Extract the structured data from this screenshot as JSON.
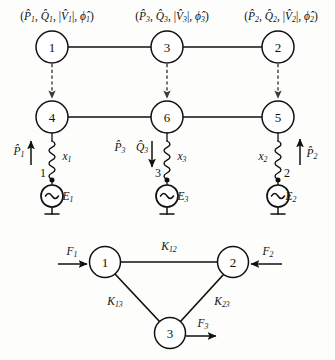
{
  "figure": {
    "title_visible": false,
    "background_color": "#fdfdfc",
    "line_color": "#111111",
    "dashed_color": "#3a3a3a"
  },
  "upper_diagram": {
    "measurement_labels": [
      {
        "id": "meas-bus-1",
        "text": "(P̂1, Q̂1, |V̂1|, ϕ̂1)",
        "parts": {
          "p": "P",
          "q": "Q",
          "v": "V",
          "phi": "ϕ",
          "index": "1"
        }
      },
      {
        "id": "meas-bus-3",
        "text": "(P̂3, Q̂3, |V̂3|, ϕ̂3)",
        "parts": {
          "p": "P",
          "q": "Q",
          "v": "V",
          "phi": "ϕ",
          "index": "3"
        }
      },
      {
        "id": "meas-bus-2",
        "text": "(P̂2, Q̂2, |V̂2|, ϕ̂2)",
        "parts": {
          "p": "P",
          "q": "Q",
          "v": "V",
          "phi": "ϕ",
          "index": "2"
        }
      }
    ],
    "top_nodes": [
      {
        "label": "1",
        "cx": 52,
        "cy": 47
      },
      {
        "label": "3",
        "cx": 167,
        "cy": 47
      },
      {
        "label": "2",
        "cx": 278,
        "cy": 47
      }
    ],
    "mid_nodes": [
      {
        "label": "4",
        "cx": 52,
        "cy": 117
      },
      {
        "label": "6",
        "cx": 167,
        "cy": 117
      },
      {
        "label": "5",
        "cx": 278,
        "cy": 117
      }
    ],
    "generators": [
      {
        "bus_number": "1",
        "emf_label": "E",
        "emf_index": "1",
        "reactance_label": "x",
        "reactance_index": "1",
        "cx": 52
      },
      {
        "bus_number": "3",
        "emf_label": "E",
        "emf_index": "3",
        "reactance_label": "x",
        "reactance_index": "3",
        "cx": 167
      },
      {
        "bus_number": "2",
        "emf_label": "E",
        "emf_index": "2",
        "reactance_label": "x",
        "reactance_index": "2",
        "cx": 278
      }
    ],
    "injection_labels": [
      {
        "symbol": "P",
        "index": "1",
        "direction": "up"
      },
      {
        "symbol": "P",
        "index": "3",
        "direction": "down"
      },
      {
        "symbol": "Q",
        "index": "3",
        "direction": "down"
      },
      {
        "symbol": "P",
        "index": "2",
        "direction": "up"
      }
    ]
  },
  "lower_diagram": {
    "nodes": [
      {
        "label": "1",
        "cx": 105,
        "cy": 262
      },
      {
        "label": "2",
        "cx": 233,
        "cy": 262
      },
      {
        "label": "3",
        "cx": 170,
        "cy": 333
      }
    ],
    "edges": [
      {
        "id": "edge-12",
        "label": "K",
        "index": "12"
      },
      {
        "id": "edge-13",
        "label": "K",
        "index": "13"
      },
      {
        "id": "edge-23",
        "label": "K",
        "index": "23"
      }
    ],
    "forces": [
      {
        "id": "force-1",
        "label": "F",
        "index": "1",
        "direction": "right"
      },
      {
        "id": "force-2",
        "label": "F",
        "index": "2",
        "direction": "left"
      },
      {
        "id": "force-3",
        "label": "F",
        "index": "3",
        "direction": "right"
      }
    ]
  }
}
